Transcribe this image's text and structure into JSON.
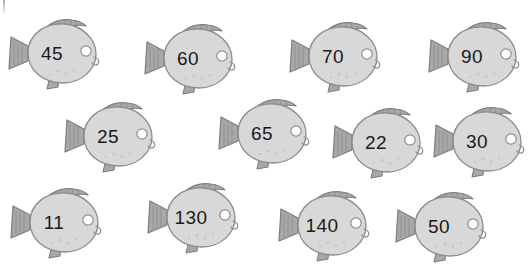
{
  "page": {
    "background_color": "#ffffff",
    "width": 532,
    "height": 269
  },
  "palette": {
    "body_fill": "#d8d8d8",
    "body_fill_light": "#e6e6e6",
    "body_outline": "#8c8c8c",
    "fin_fill": "#a8a8a8",
    "fin_outline": "#7d7d7d",
    "fin_stripe": "#8e8e8e",
    "eye_white": "#ffffff",
    "eye_outline": "#8c8c8c",
    "number_color": "#1a1a1a"
  },
  "fish_group": {
    "icon": "fish-icon",
    "count": 12,
    "rows": [
      {
        "row_label": "row-1",
        "fish": [
          {
            "id": "fish-45",
            "number": "45",
            "x": 6,
            "y": 13
          },
          {
            "id": "fish-60",
            "number": "60",
            "x": 142,
            "y": 18
          },
          {
            "id": "fish-70",
            "number": "70",
            "x": 287,
            "y": 16
          },
          {
            "id": "fish-90",
            "number": "90",
            "x": 426,
            "y": 16
          }
        ]
      },
      {
        "row_label": "row-2",
        "fish": [
          {
            "id": "fish-25",
            "number": "25",
            "x": 62,
            "y": 96
          },
          {
            "id": "fish-65",
            "number": "65",
            "x": 216,
            "y": 93
          },
          {
            "id": "fish-22",
            "number": "22",
            "x": 330,
            "y": 102
          },
          {
            "id": "fish-30",
            "number": "30",
            "x": 431,
            "y": 101
          }
        ]
      },
      {
        "row_label": "row-3",
        "fish": [
          {
            "id": "fish-11",
            "number": "11",
            "x": 8,
            "y": 182
          },
          {
            "id": "fish-130",
            "number": "130",
            "x": 145,
            "y": 177
          },
          {
            "id": "fish-140",
            "number": "140",
            "x": 276,
            "y": 185
          },
          {
            "id": "fish-50",
            "number": "50",
            "x": 393,
            "y": 186
          }
        ]
      }
    ]
  }
}
